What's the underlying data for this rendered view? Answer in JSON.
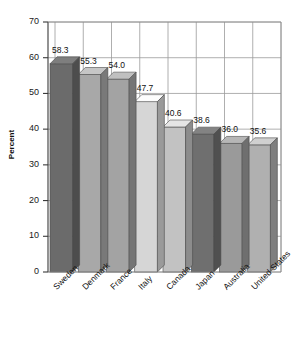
{
  "chart_data": {
    "type": "bar",
    "title": "",
    "subtitle": "",
    "xlabel": "",
    "ylabel": "Percent",
    "ylim": [
      0,
      70
    ],
    "yticks": [
      0,
      10,
      20,
      30,
      40,
      50,
      60,
      70
    ],
    "ytick_labels": [
      "0",
      "10",
      "20",
      "30",
      "40",
      "50",
      "60",
      "70"
    ],
    "grid": true,
    "grid_axes": "both",
    "legend": "none",
    "style": "3d-bar",
    "categories": [
      "Sweden",
      "Denmark",
      "France",
      "Italy",
      "Canada",
      "Japan",
      "Australia",
      "United States"
    ],
    "values": [
      58.3,
      55.3,
      54.0,
      47.7,
      40.6,
      38.6,
      36.0,
      35.6
    ],
    "data_labels": [
      "58.3",
      "55.3",
      "54.0",
      "47.7",
      "40.6",
      "38.6",
      "36.0",
      "35.6"
    ],
    "bar_colors": [
      "#6b6b6b",
      "#a8a8a8",
      "#a3a3a3",
      "#d6d6d6",
      "#c2c2c2",
      "#6f6f6f",
      "#9a9a9a",
      "#b0b0b0"
    ]
  },
  "axes": {
    "y_title": "Percent",
    "frame_color": "#8a8a8a",
    "grid_color": "#9a9a9a",
    "text_color": "#111111"
  }
}
